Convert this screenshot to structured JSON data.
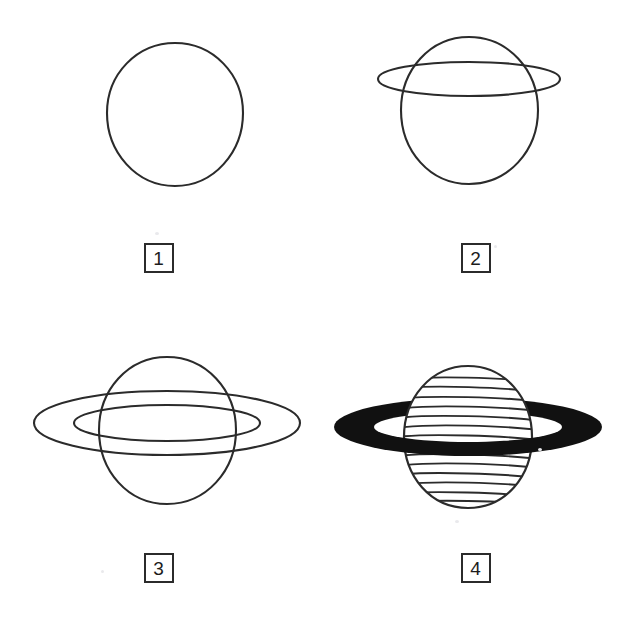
{
  "document": {
    "kind": "drawing-tutorial-sheet",
    "subject": "Saturn",
    "background_color": "#ffffff",
    "ink_color": "#2b2b2b",
    "fill_color": "#111111",
    "canvas": {
      "width": 634,
      "height": 620
    }
  },
  "steps": [
    {
      "number": "1",
      "label": "1",
      "caption": "",
      "figure_name": "saturn-step-1-sphere-outline",
      "elements": [
        "sphere-outline"
      ],
      "sphere": {
        "cx": 175,
        "cy": 114,
        "rx": 68,
        "ry": 71
      },
      "rings": [],
      "bands": 0
    },
    {
      "number": "2",
      "label": "2",
      "caption": "",
      "figure_name": "saturn-step-2-single-ring-ellipse",
      "elements": [
        "sphere-outline",
        "ring-ellipse-outer"
      ],
      "sphere": {
        "cx": 152,
        "cy": 110,
        "rx": 68,
        "ry": 73
      },
      "rings": [
        {
          "name": "ring-ellipse-outer",
          "cx": 152,
          "cy": 79,
          "rx": 91,
          "ry": 17
        }
      ],
      "bands": 0
    },
    {
      "number": "3",
      "label": "3",
      "caption": "",
      "figure_name": "saturn-step-3-double-ring-ellipse",
      "elements": [
        "sphere-outline",
        "ring-ellipse-outer",
        "ring-ellipse-inner"
      ],
      "sphere": {
        "cx": 167,
        "cy": 120,
        "rx": 68,
        "ry": 73
      },
      "rings": [
        {
          "name": "ring-ellipse-outer",
          "cx": 167,
          "cy": 113,
          "rx": 133,
          "ry": 32
        },
        {
          "name": "ring-ellipse-inner",
          "cx": 167,
          "cy": 113,
          "rx": 93,
          "ry": 18
        }
      ],
      "bands": 0
    },
    {
      "number": "4",
      "label": "4",
      "caption": "",
      "figure_name": "saturn-step-4-filled-ring-and-bands",
      "elements": [
        "ring-filled-back",
        "sphere-outline",
        "sphere-bands",
        "ring-filled-front"
      ],
      "sphere": {
        "cx": 151,
        "cy": 127,
        "rx": 64,
        "ry": 71
      },
      "rings": [
        {
          "name": "ring-filled-outer",
          "cx": 151,
          "cy": 117,
          "rx": 134,
          "ry": 29
        },
        {
          "name": "ring-filled-inner",
          "cx": 151,
          "cy": 117,
          "rx": 94,
          "ry": 15
        }
      ],
      "bands": 17
    }
  ]
}
